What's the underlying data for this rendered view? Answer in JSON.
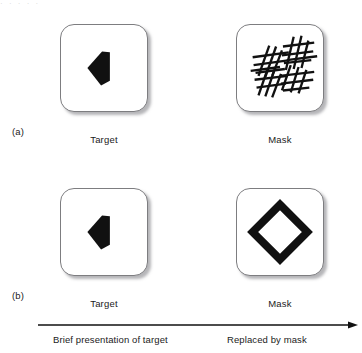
{
  "figure": {
    "top_artifact": "· · · · ·",
    "ink_color": "#111111",
    "card_border_color": "#7d7d80",
    "shadow_color": "#787880"
  },
  "rows": [
    {
      "label": "(a)",
      "panels": [
        {
          "caption": "Target",
          "stimulus": "solid-truncated-diamond"
        },
        {
          "caption": "Mask",
          "stimulus": "crosshatch-lines-mask"
        }
      ]
    },
    {
      "label": "(b)",
      "panels": [
        {
          "caption": "Target",
          "stimulus": "solid-truncated-diamond"
        },
        {
          "caption": "Mask",
          "stimulus": "outline-diamond-mask"
        }
      ]
    }
  ],
  "timeline": {
    "arrow_direction": "left-to-right",
    "left_caption": "Brief presentation of target",
    "right_caption": "Replaced by mask"
  }
}
